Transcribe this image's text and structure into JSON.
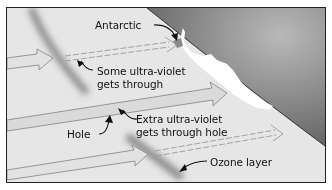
{
  "diagram": {
    "labels": {
      "antarctic": "Antarctic",
      "some_uv_line1": "Some ultra-violet",
      "some_uv_line2": "gets through",
      "extra_uv_line1": "Extra ultra-violet",
      "extra_uv_line2": "gets through hole",
      "hole": "Hole",
      "ozone_layer": "Ozone layer"
    },
    "colors": {
      "background": "#e6e6e6",
      "earth": "#7a7a7a",
      "earth_light": "#a8a8a8",
      "antarctica": "#ffffff",
      "ozone_band": "#8a8a8a",
      "arrow_fill": "#dcdcdc",
      "arrow_stroke": "#8c8c8c",
      "text": "#111111",
      "frame": "#222222"
    }
  }
}
